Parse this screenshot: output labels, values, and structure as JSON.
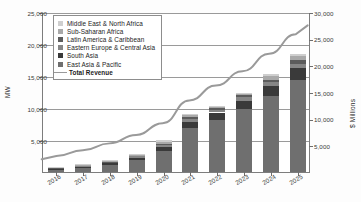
{
  "chart_data": {
    "type": "bar",
    "title": "",
    "xlabel": "",
    "ylabel": "MW",
    "ylabel_secondary": "$ Millions",
    "grid": true,
    "legend_position": "top-left",
    "categories": [
      "2016",
      "2017",
      "2018",
      "2019",
      "2020",
      "2021",
      "2022",
      "2023",
      "2024",
      "2025"
    ],
    "ylim": [
      0,
      25000
    ],
    "ylim_secondary": [
      0,
      30000
    ],
    "yticks": [
      "5,000",
      "10,000",
      "15,000",
      "20,000",
      "25,000"
    ],
    "yticks_secondary": [
      "5,000",
      "10,000",
      "15,000",
      "20,000",
      "25,000",
      "30,000"
    ],
    "series": [
      {
        "name": "East Asia & Pacific",
        "color": "#6f6f6f",
        "values": [
          430,
          700,
          1150,
          1900,
          3350,
          6900,
          8200,
          9800,
          11800,
          14300
        ]
      },
      {
        "name": "South Asia",
        "color": "#3a3a3a",
        "values": [
          90,
          150,
          230,
          330,
          500,
          950,
          1100,
          1350,
          1600,
          1900
        ]
      },
      {
        "name": "Eastern Europe & Central Asia",
        "color": "#868686",
        "values": [
          60,
          95,
          150,
          210,
          330,
          500,
          450,
          500,
          600,
          750
        ]
      },
      {
        "name": "Latin America & Caribbean",
        "color": "#5c5c5c",
        "values": [
          50,
          75,
          110,
          160,
          250,
          300,
          300,
          330,
          450,
          560
        ]
      },
      {
        "name": "Sub-Saharan Africa",
        "color": "#a9a9a9",
        "values": [
          40,
          60,
          90,
          130,
          200,
          230,
          180,
          200,
          520,
          560
        ]
      },
      {
        "name": "Middle East & North Africa",
        "color": "#cfcfcf",
        "values": [
          30,
          45,
          70,
          110,
          420,
          180,
          150,
          170,
          380,
          430
        ]
      }
    ],
    "line_series": {
      "name": "Total Revenue",
      "color": "#9a9a9a",
      "axis": "secondary",
      "values": [
        3000,
        4100,
        5400,
        7000,
        9200,
        13500,
        16300,
        19000,
        22300,
        26000
      ]
    }
  },
  "legend": {
    "items": [
      {
        "label": "Middle East & North Africa",
        "type": "swatch",
        "color": "#cfcfcf"
      },
      {
        "label": "Sub-Saharan Africa",
        "type": "swatch",
        "color": "#a9a9a9"
      },
      {
        "label": "Latin America & Caribbean",
        "type": "swatch",
        "color": "#5c5c5c"
      },
      {
        "label": "Eastern Europe & Central Asia",
        "type": "swatch",
        "color": "#868686"
      },
      {
        "label": "South Asia",
        "type": "swatch",
        "color": "#3a3a3a"
      },
      {
        "label": "East Asia & Pacific",
        "type": "swatch",
        "color": "#6f6f6f"
      },
      {
        "label": "Total Revenue",
        "type": "line",
        "color": "#9a9a9a"
      }
    ]
  }
}
